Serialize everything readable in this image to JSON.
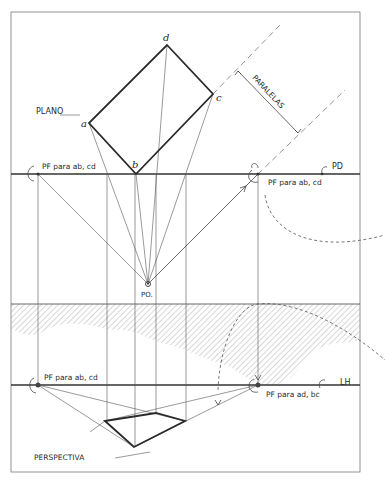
{
  "labels": {
    "plano": "PLANO",
    "perspectiva": "PERSPECTIVA",
    "paralelas": "PARALELAS",
    "pd": "PD",
    "lh": "LH",
    "po": "PO.",
    "pf_left_top": "PF para ab, cd",
    "pf_right_top": "PF para ab, cd",
    "pf_left_bottom": "PF para ab, cd",
    "pf_right_bottom": "PF para ad, bc"
  },
  "vertices": {
    "a": "a",
    "b": "b",
    "c": "c",
    "d": "d"
  },
  "colors": {
    "ink": "#2a2a2a",
    "hatch": "#9a9a9a",
    "background": "#ffffff"
  }
}
